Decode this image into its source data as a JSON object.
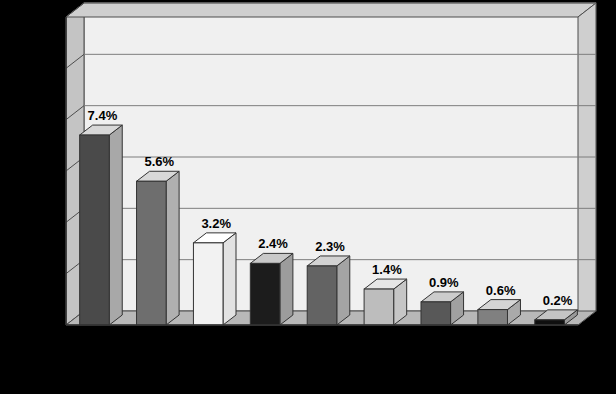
{
  "chart_data": {
    "type": "bar",
    "title": "",
    "subtitle": "",
    "xlabel": "Country",
    "ylabel_lines": [
      "Real GDP",
      "growth",
      "rates",
      "(percent)"
    ],
    "ylabel": "Real GDP growth rates (percent)",
    "categories": [
      "China",
      "India",
      "United Kingdom",
      "United States",
      "Canada",
      "Germany",
      "Japan",
      "Greece",
      "Russia"
    ],
    "category_lines": [
      [
        "China"
      ],
      [
        "India"
      ],
      [
        "United",
        "Kingdom"
      ],
      [
        "United",
        "States"
      ],
      [
        "Canada"
      ],
      [
        "Germany"
      ],
      [
        "Japan"
      ],
      [
        "Greece"
      ],
      [
        "Russia"
      ]
    ],
    "values": [
      7.4,
      5.6,
      3.2,
      2.4,
      2.3,
      1.4,
      0.9,
      0.6,
      0.2
    ],
    "data_labels": [
      "7.4%",
      "5.6%",
      "3.2%",
      "2.4%",
      "2.3%",
      "1.4%",
      "0.9%",
      "0.6%",
      "0.2%"
    ],
    "ylim": [
      0,
      12
    ],
    "yticks": [
      0,
      2,
      4,
      6,
      8,
      10,
      12
    ],
    "ytick_labels": [
      "0",
      "2",
      "4",
      "6",
      "8",
      "10",
      "12"
    ],
    "grid": true,
    "legend": "none",
    "bar_colors": [
      "#4a4a4a",
      "#6e6e6e",
      "#f2f2f2",
      "#1c1c1c",
      "#636363",
      "#bdbdbd",
      "#585858",
      "#808080",
      "#0f0f0f"
    ],
    "bar_top_colors": [
      "#d8d8d8",
      "#d8d8d8",
      "#ffffff",
      "#c9c9c9",
      "#d2d2d2",
      "#e6e6e6",
      "#cccccc",
      "#d5d5d5",
      "#c4c4c4"
    ],
    "bar_side_colors": [
      "#a8a8a8",
      "#b0b0b0",
      "#e2e2e2",
      "#9c9c9c",
      "#a4a4a4",
      "#c6c6c6",
      "#a0a0a0",
      "#aaaaaa",
      "#9a9a9a"
    ],
    "style": "3d"
  },
  "page": {
    "background_color": "#d9d9d9",
    "plot_face_color": "#f0f0f0",
    "wall_color": "#c4c4c4",
    "floor_color": "#b8b8b8",
    "gridline_color": "#7d7d7d",
    "axis_color": "#333333"
  }
}
